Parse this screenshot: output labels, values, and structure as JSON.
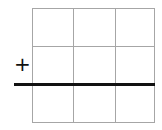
{
  "diagram": {
    "grid": {
      "rows": 3,
      "cols": 3,
      "line_color": "#a6a6a6"
    },
    "baseline": {
      "color": "#111111",
      "after_row": 2
    },
    "marker": {
      "symbol": "+",
      "color": "#111111"
    }
  }
}
